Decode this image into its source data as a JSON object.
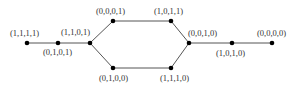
{
  "diagram": {
    "type": "graph",
    "nodes": [
      {
        "id": "n1111",
        "label": "(1,1,1,1)",
        "x": 27,
        "y": 43,
        "lx": 10,
        "ly": 36
      },
      {
        "id": "n0101",
        "label": "(0,1,0,1)",
        "x": 58,
        "y": 43,
        "lx": 43,
        "ly": 55
      },
      {
        "id": "n1101",
        "label": "(1,1,0,1)",
        "x": 90,
        "y": 43,
        "lx": 61,
        "ly": 35
      },
      {
        "id": "n0001",
        "label": "(0,0,0,1)",
        "x": 113,
        "y": 21,
        "lx": 96,
        "ly": 14
      },
      {
        "id": "n0100",
        "label": "(0,1,0,0)",
        "x": 113,
        "y": 68,
        "lx": 99,
        "ly": 81
      },
      {
        "id": "n1011",
        "label": "(1,0,1,1)",
        "x": 171,
        "y": 21,
        "lx": 154,
        "ly": 14
      },
      {
        "id": "n1110",
        "label": "(1,1,1,0)",
        "x": 171,
        "y": 68,
        "lx": 160,
        "ly": 81
      },
      {
        "id": "n0010",
        "label": "(0,0,1,0)",
        "x": 189,
        "y": 43,
        "lx": 188,
        "ly": 36
      },
      {
        "id": "n1010",
        "label": "(1,0,1,0)",
        "x": 232,
        "y": 43,
        "lx": 216,
        "ly": 56
      },
      {
        "id": "n0000",
        "label": "(0,0,0,0)",
        "x": 272,
        "y": 43,
        "lx": 257,
        "ly": 36
      }
    ],
    "edges": [
      [
        "n1111",
        "n0101"
      ],
      [
        "n0101",
        "n1101"
      ],
      [
        "n1101",
        "n0001"
      ],
      [
        "n1101",
        "n0100"
      ],
      [
        "n0001",
        "n1011"
      ],
      [
        "n0100",
        "n1110"
      ],
      [
        "n1011",
        "n0010"
      ],
      [
        "n1110",
        "n0010"
      ],
      [
        "n0010",
        "n1010"
      ],
      [
        "n1010",
        "n0000"
      ]
    ]
  }
}
